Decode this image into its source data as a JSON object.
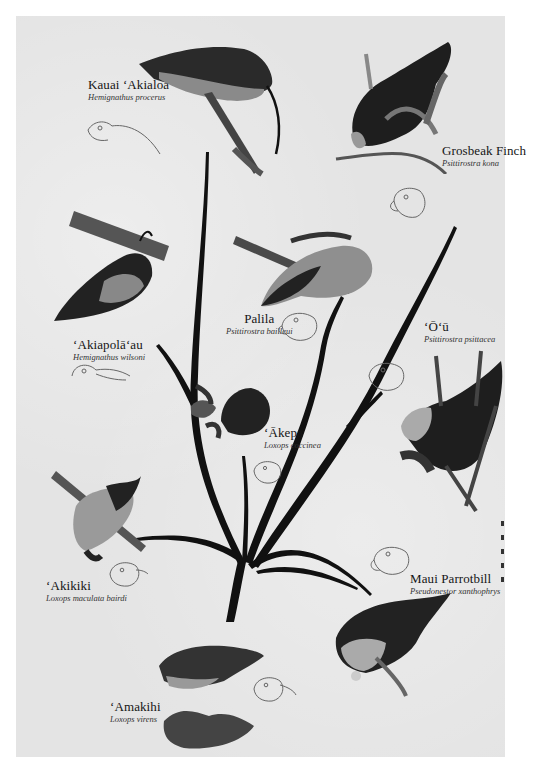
{
  "poster": {
    "title": "Hawaiian Honeycreepers – adaptive radiation tree",
    "background": "#e4e4e4",
    "ink": "#111111"
  },
  "species": [
    {
      "id": "kauai-akialoa",
      "common": "Kauai ʻAkialoa",
      "scientific": "Hemignathus procerus"
    },
    {
      "id": "grosbeak-finch",
      "common": "Grosbeak Finch",
      "scientific": "Psittirostra kona"
    },
    {
      "id": "akiapolaau",
      "common": "ʻAkiapolāʻau",
      "scientific": "Hemignathus wilsoni"
    },
    {
      "id": "palila",
      "common": "Palila",
      "scientific": "Psittirostra bailleui"
    },
    {
      "id": "ou",
      "common": "ʻŌʻū",
      "scientific": "Psittirostra psittacea"
    },
    {
      "id": "akepa",
      "common": "ʻĀkepa",
      "scientific": "Loxops coccinea"
    },
    {
      "id": "akikiki",
      "common": "ʻAkikiki",
      "scientific": "Loxops maculata bairdi"
    },
    {
      "id": "maui-parrotbill",
      "common": "Maui Parrotbill",
      "scientific": "Pseudonestor xanthophrys"
    },
    {
      "id": "amakihi",
      "common": "ʻAmakihi",
      "scientific": "Loxops virens"
    }
  ],
  "signature": "artist signature"
}
